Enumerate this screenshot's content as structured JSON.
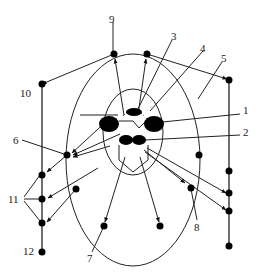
{
  "diagram": {
    "type": "schematic",
    "labels": [
      {
        "id": "1",
        "text": "1",
        "x": 243,
        "y": 110
      },
      {
        "id": "2",
        "text": "2",
        "x": 243,
        "y": 132
      },
      {
        "id": "3",
        "text": "3",
        "x": 171,
        "y": 34
      },
      {
        "id": "4",
        "text": "4",
        "x": 200,
        "y": 46
      },
      {
        "id": "5",
        "text": "5",
        "x": 220,
        "y": 56
      },
      {
        "id": "6",
        "text": "6",
        "x": 13,
        "y": 140
      },
      {
        "id": "7",
        "text": "7",
        "x": 87,
        "y": 254
      },
      {
        "id": "8",
        "text": "8",
        "x": 194,
        "y": 222
      },
      {
        "id": "9",
        "text": "9",
        "x": 109,
        "y": 17
      },
      {
        "id": "10",
        "text": "10",
        "x": 21,
        "y": 90
      },
      {
        "id": "11",
        "text": "11",
        "x": 9,
        "y": 195
      },
      {
        "id": "12",
        "text": "12",
        "x": 23,
        "y": 245
      }
    ],
    "colors": {
      "stroke": "#222222",
      "fill": "#000000",
      "background": "#ffffff"
    }
  }
}
